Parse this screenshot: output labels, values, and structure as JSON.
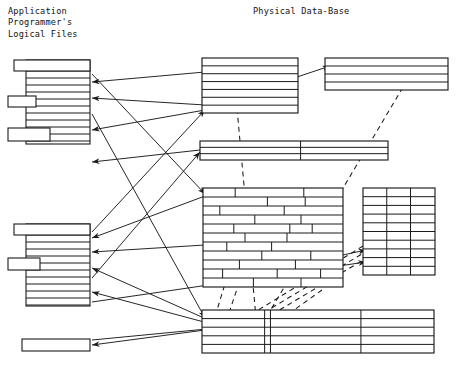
{
  "figure": {
    "kind": "diagram",
    "background_color": "#ffffff",
    "line_color": "#1a1a1a",
    "headings": {
      "left": "Application\nProgrammer's\nLogical Files",
      "right": "Physical Data-Base"
    }
  },
  "logical_files": {
    "group_label": "Application Programmer's Logical Files",
    "blocks": [
      {
        "name": "logical-file-block-1",
        "x": 14,
        "y": 60,
        "width": 76,
        "height": 84,
        "header_bar": {
          "x": 14,
          "y": 60,
          "width": 76,
          "height": 11,
          "protrude_left": 0
        },
        "record_lines": [
          71,
          78,
          85,
          92,
          99,
          106,
          113,
          120,
          127,
          134,
          141
        ],
        "tabs": [
          {
            "x": 8,
            "y": 96,
            "width": 28,
            "height": 11
          },
          {
            "x": 8,
            "y": 128,
            "width": 42,
            "height": 13
          }
        ],
        "body_left": 26,
        "body_right": 90
      },
      {
        "name": "logical-file-block-2",
        "x": 14,
        "y": 224,
        "width": 76,
        "height": 82,
        "header_bar": {
          "x": 14,
          "y": 224,
          "width": 76,
          "height": 11
        },
        "record_lines": [
          235,
          242,
          249,
          256,
          263,
          270,
          277,
          284,
          291,
          298,
          305
        ],
        "tabs": [
          {
            "x": 8,
            "y": 258,
            "width": 32,
            "height": 12
          }
        ],
        "body_left": 26,
        "body_right": 90
      },
      {
        "name": "logical-file-block-3",
        "x": 22,
        "y": 339,
        "width": 68,
        "height": 12,
        "single_bar": true
      }
    ]
  },
  "physical_database": {
    "group_label": "Physical Data-Base",
    "tables": [
      {
        "name": "physical-table-top-left",
        "x": 202,
        "y": 58,
        "width": 96,
        "height": 55,
        "rows": 7,
        "columns": 1,
        "pattern": "rows"
      },
      {
        "name": "physical-table-top-right",
        "x": 325,
        "y": 58,
        "width": 123,
        "height": 32,
        "rows": 4,
        "columns": 1,
        "pattern": "rows"
      },
      {
        "name": "physical-table-middle-bar",
        "x": 200,
        "y": 141,
        "width": 188,
        "height": 19,
        "rows": 3,
        "columns": 2,
        "column_splits": [
          0.535
        ],
        "pattern": "rows-with-split"
      },
      {
        "name": "physical-table-brick",
        "x": 203,
        "y": 188,
        "width": 140,
        "height": 99,
        "rows": 11,
        "pattern": "brick",
        "brick_splits": [
          [
            0.23,
            0.72
          ],
          [
            0.46,
            0.73
          ],
          [
            0.12,
            0.58
          ],
          [
            0.37,
            0.7
          ],
          [
            0.22,
            0.62,
            0.78
          ],
          [
            0.3,
            0.6
          ],
          [
            0.17,
            0.49
          ],
          [
            0.42,
            0.77
          ],
          [
            0.26,
            0.66
          ],
          [
            0.14,
            0.53,
            0.84
          ],
          [
            0.36,
            0.7
          ]
        ]
      },
      {
        "name": "physical-table-grid",
        "x": 363,
        "y": 188,
        "width": 72,
        "height": 87,
        "rows": 10,
        "columns": 3,
        "column_splits": [
          0.33,
          0.66
        ],
        "pattern": "grid"
      },
      {
        "name": "physical-table-bottom",
        "x": 202,
        "y": 310,
        "width": 232,
        "height": 43,
        "rows": 5,
        "columns": 4,
        "column_splits": [
          0.27,
          0.295,
          0.685
        ],
        "pattern": "rows-with-split"
      }
    ]
  },
  "mappings": {
    "solid_arrows": [
      {
        "name": "mapping-arrow-1",
        "x1": 205,
        "y1": 72,
        "x2": 92,
        "y2": 82,
        "heads": "end"
      },
      {
        "name": "mapping-arrow-2",
        "x1": 205,
        "y1": 105,
        "x2": 92,
        "y2": 98,
        "heads": "end"
      },
      {
        "name": "mapping-arrow-3",
        "x1": 205,
        "y1": 110,
        "x2": 92,
        "y2": 130,
        "heads": "end"
      },
      {
        "name": "mapping-arrow-4",
        "x1": 200,
        "y1": 150,
        "x2": 92,
        "y2": 162,
        "heads": "end"
      },
      {
        "name": "mapping-arrow-5",
        "x1": 205,
        "y1": 196,
        "x2": 92,
        "y2": 238,
        "heads": "end"
      },
      {
        "name": "mapping-arrow-6",
        "x1": 205,
        "y1": 245,
        "x2": 92,
        "y2": 252,
        "heads": "end"
      },
      {
        "name": "mapping-arrow-7",
        "x1": 204,
        "y1": 318,
        "x2": 92,
        "y2": 268,
        "heads": "end"
      },
      {
        "name": "mapping-arrow-8",
        "x1": 204,
        "y1": 322,
        "x2": 92,
        "y2": 292,
        "heads": "end"
      },
      {
        "name": "mapping-arrow-9",
        "x1": 205,
        "y1": 330,
        "x2": 92,
        "y2": 345,
        "heads": "end"
      },
      {
        "name": "mapping-arrow-10",
        "x1": 92,
        "y1": 74,
        "x2": 205,
        "y2": 194,
        "heads": "end"
      },
      {
        "name": "mapping-arrow-11",
        "x1": 92,
        "y1": 114,
        "x2": 205,
        "y2": 318,
        "heads": "end"
      },
      {
        "name": "mapping-arrow-12",
        "x1": 92,
        "y1": 232,
        "x2": 205,
        "y2": 110,
        "heads": "end"
      },
      {
        "name": "mapping-arrow-13",
        "x1": 92,
        "y1": 278,
        "x2": 200,
        "y2": 152,
        "heads": "end"
      },
      {
        "name": "mapping-arrow-14",
        "x1": 92,
        "y1": 302,
        "x2": 366,
        "y2": 262,
        "heads": "end"
      },
      {
        "name": "mapping-arrow-15",
        "x1": 92,
        "y1": 340,
        "x2": 363,
        "y2": 314,
        "heads": "end"
      },
      {
        "name": "mapping-arrow-16",
        "x1": 207,
        "y1": 107,
        "x2": 330,
        "y2": 66,
        "heads": "end"
      },
      {
        "name": "mapping-arrow-17",
        "x1": 204,
        "y1": 285,
        "x2": 366,
        "y2": 250,
        "heads": "end"
      }
    ],
    "dashed_links": [
      {
        "name": "dashed-link-1",
        "points": "233,64 258,340"
      },
      {
        "name": "dashed-link-2",
        "points": "322,290 252,340"
      },
      {
        "name": "dashed-link-3",
        "points": "412,72 254,338"
      },
      {
        "name": "dashed-link-4",
        "points": "400,238 246,330"
      },
      {
        "name": "dashed-link-5",
        "points": "392,236 238,328"
      },
      {
        "name": "dashed-link-6",
        "points": "386,232 232,326"
      },
      {
        "name": "dashed-link-7",
        "points": "248,208 214,320"
      },
      {
        "name": "dashed-link-8",
        "points": "262,214 226,322"
      }
    ]
  }
}
